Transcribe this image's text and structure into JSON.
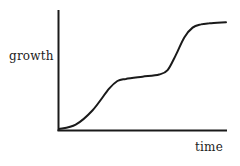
{
  "chart_data": {
    "type": "line",
    "title": "",
    "xlabel": "time",
    "ylabel": "growth",
    "grid": false,
    "legend": null,
    "ticks": false,
    "x": [
      0,
      0.1,
      0.2,
      0.3,
      0.35,
      0.4,
      0.5,
      0.6,
      0.65,
      0.7,
      0.75,
      0.8,
      0.85,
      0.9,
      1.0
    ],
    "series": [
      {
        "name": "growth",
        "values": [
          0,
          0.04,
          0.17,
          0.37,
          0.44,
          0.46,
          0.48,
          0.5,
          0.54,
          0.68,
          0.84,
          0.93,
          0.96,
          0.97,
          0.98
        ]
      }
    ],
    "xlim": [
      0,
      1
    ],
    "ylim": [
      0,
      1
    ]
  },
  "colors": {
    "background": "#ffffff",
    "line": "#1a1a1a",
    "axis": "#1a1a1a",
    "text": "#222222"
  }
}
